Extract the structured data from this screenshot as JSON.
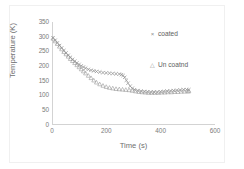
{
  "chart_data": {
    "type": "scatter",
    "title": "",
    "xlabel": "Time (s)",
    "ylabel": "Temperature (K)",
    "xlim": [
      0,
      600
    ],
    "ylim": [
      0,
      350
    ],
    "xticks": [
      0,
      200,
      400,
      600
    ],
    "yticks": [
      0,
      50,
      100,
      150,
      200,
      250,
      300,
      350
    ],
    "grid": false,
    "legend_position": "top-right",
    "series": [
      {
        "name": "coated",
        "marker": "x",
        "marker_glyph": "×",
        "color": "#8d8d8d",
        "x": [
          0,
          8,
          16,
          24,
          32,
          40,
          48,
          56,
          64,
          72,
          80,
          88,
          96,
          104,
          112,
          120,
          130,
          140,
          150,
          160,
          172,
          184,
          196,
          208,
          220,
          232,
          244,
          252,
          258,
          264,
          270,
          276,
          284,
          292,
          300,
          312,
          324,
          336,
          348,
          360,
          372,
          384,
          396,
          408,
          420,
          432,
          444,
          456,
          468,
          480,
          492,
          500
        ],
        "y": [
          296,
          288,
          279,
          270,
          262,
          253,
          245,
          237,
          230,
          223,
          217,
          211,
          206,
          201,
          197,
          193,
          189,
          186,
          184,
          182,
          180,
          178,
          177,
          176,
          175,
          174,
          173,
          171,
          168,
          162,
          152,
          142,
          132,
          125,
          120,
          117,
          115,
          114,
          113,
          112,
          112,
          112,
          113,
          114,
          115,
          116,
          117,
          118,
          119,
          120,
          120,
          120
        ]
      },
      {
        "name": "Un coatnd",
        "marker": "triangle",
        "marker_glyph": "△",
        "color": "#9a9a9a",
        "x": [
          0,
          8,
          16,
          24,
          32,
          40,
          48,
          56,
          64,
          72,
          80,
          88,
          96,
          104,
          112,
          120,
          130,
          140,
          150,
          160,
          172,
          184,
          196,
          208,
          220,
          232,
          244,
          256,
          268,
          280,
          292,
          304,
          316,
          328,
          340,
          352,
          364,
          376,
          388,
          400,
          412,
          424,
          436,
          448,
          460,
          472,
          484,
          496,
          500
        ],
        "y": [
          294,
          285,
          276,
          267,
          258,
          249,
          241,
          233,
          225,
          218,
          211,
          204,
          197,
          190,
          183,
          176,
          168,
          160,
          152,
          145,
          139,
          134,
          130,
          127,
          125,
          123,
          122,
          121,
          120,
          119,
          117,
          115,
          113,
          112,
          111,
          110,
          110,
          110,
          110,
          111,
          111,
          112,
          112,
          113,
          113,
          114,
          114,
          115,
          115
        ]
      }
    ]
  },
  "legend": {
    "entries": [
      {
        "label": "coated",
        "glyph": "×"
      },
      {
        "label": "Un coatnd",
        "glyph": "△"
      }
    ]
  },
  "axes": {
    "x_title": "Time (s)",
    "y_title": "Temperature (K)"
  }
}
